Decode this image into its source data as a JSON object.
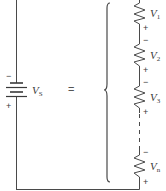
{
  "figure": {
    "type": "series-circuit-equivalence",
    "colors": {
      "wire": "#4a4a4a",
      "text": "#3a3a3a",
      "background": "#ffffff"
    },
    "source": {
      "symbol": "V",
      "subscript": "S",
      "minus": "−",
      "plus": "+"
    },
    "equals": "=",
    "resistors": [
      {
        "symbol": "V",
        "subscript": "1",
        "minus": "−",
        "plus": "+"
      },
      {
        "symbol": "V",
        "subscript": "2",
        "minus": "−",
        "plus": "+"
      },
      {
        "symbol": "V",
        "subscript": "3",
        "minus": "−",
        "plus": "+"
      },
      {
        "symbol": "V",
        "subscript": "n",
        "minus": "−",
        "plus": "+"
      }
    ]
  }
}
